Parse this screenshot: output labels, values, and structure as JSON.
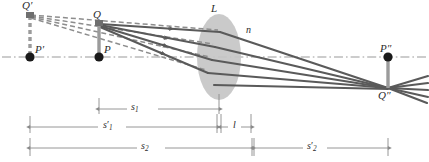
{
  "figure": {
    "colors": {
      "ray": "#5a5a5a",
      "virtual_ray": "#8d8d8d",
      "axis": "#9a9a9a",
      "lens_fill": "#c6c6c6",
      "object_stem": "#8f8f8f",
      "point": "#1a1a1a",
      "dimension": "#8a8a8a",
      "label_text": "#2b2b2b"
    },
    "points": [
      {
        "id": "Q-prime",
        "label": "Q",
        "prime": "′",
        "x": 30,
        "y": 13,
        "kind": "virtual-object-tip"
      },
      {
        "id": "P-prime",
        "label": "P",
        "prime": "′",
        "x": 30,
        "y": 57,
        "kind": "axis-point"
      },
      {
        "id": "Q",
        "label": "Q",
        "prime": "",
        "x": 99,
        "y": 22,
        "kind": "object-tip"
      },
      {
        "id": "P",
        "label": "P",
        "prime": "",
        "x": 99,
        "y": 57,
        "kind": "axis-point"
      },
      {
        "id": "P-dprime",
        "label": "P",
        "prime": "″",
        "x": 388,
        "y": 57,
        "kind": "axis-point"
      },
      {
        "id": "Q-dprime",
        "label": "Q",
        "prime": "″",
        "x": 388,
        "y": 88,
        "kind": "image-tip"
      }
    ],
    "labels": [
      {
        "id": "label-Q-prime",
        "text": "Q′",
        "x": 23,
        "y": 1
      },
      {
        "id": "label-P-prime",
        "text": "P′",
        "x": 35,
        "y": 45
      },
      {
        "id": "label-Q",
        "text": "Q",
        "x": 94,
        "y": 10
      },
      {
        "id": "label-P",
        "text": "P",
        "x": 104,
        "y": 45
      },
      {
        "id": "label-L",
        "text": "L",
        "x": 211,
        "y": 4
      },
      {
        "id": "label-n",
        "text": "n",
        "x": 246,
        "y": 25
      },
      {
        "id": "label-P-dprime",
        "text": "P″",
        "x": 381,
        "y": 44
      },
      {
        "id": "label-Q-dprime",
        "text": "Q″",
        "x": 379,
        "y": 91
      }
    ],
    "lens": {
      "name": "L",
      "index_symbol": "n",
      "cx": 219,
      "cy": 57,
      "rx": 22,
      "ry": 43
    },
    "axis": {
      "y": 57,
      "x_start": 2,
      "x_end": 427,
      "style": "dash-dot"
    },
    "dimensions": [
      {
        "id": "s1",
        "symbol": "s",
        "sub": "1",
        "prime": "",
        "x1": 99,
        "x2": 219,
        "y": 109,
        "tick_top": 98
      },
      {
        "id": "s1-prime",
        "symbol": "s",
        "sub": "1",
        "prime": "′",
        "x1": 30,
        "x2": 216,
        "y": 127,
        "tick_top": 116
      },
      {
        "id": "l",
        "symbol": "l",
        "sub": "",
        "prime": "",
        "x1": 222,
        "x2": 251,
        "y": 127,
        "tick_top": 116
      },
      {
        "id": "s2",
        "symbol": "s",
        "sub": "2",
        "prime": "",
        "x1": 30,
        "x2": 251,
        "y": 148,
        "tick_top": 138
      },
      {
        "id": "s2-prime",
        "symbol": "s",
        "sub": "2",
        "prime": "′",
        "x1": 253,
        "x2": 388,
        "y": 148,
        "tick_top": 138
      }
    ],
    "rays": {
      "real_count": 4,
      "virtual_count": 4,
      "description": "Four solid rays leave Q, refract through lens L and converge at Q″; four dashed back-extensions meet at the virtual object tip Q′."
    }
  }
}
